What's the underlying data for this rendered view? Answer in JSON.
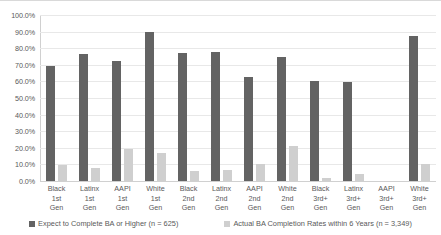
{
  "chart_data": {
    "type": "bar",
    "title": "",
    "xlabel": "",
    "ylabel": "",
    "ylim": [
      0,
      100
    ],
    "grid": true,
    "legend_position": "bottom",
    "categories": [
      "Black 1st Gen",
      "Latinx 1st Gen",
      "AAPI 1st Gen",
      "White 1st Gen",
      "Black 2nd Gen",
      "Latinx 2nd Gen",
      "AAPI 2nd Gen",
      "White 2nd Gen",
      "Black 3rd+ Gen",
      "Latinx 3rd+ Gen",
      "AAPI 3rd+ Gen",
      "White 3rd+ Gen"
    ],
    "category_lines": [
      [
        "Black",
        "1st",
        "Gen"
      ],
      [
        "Latinx",
        "1st",
        "Gen"
      ],
      [
        "AAPI",
        "1st",
        "Gen"
      ],
      [
        "White",
        "1st",
        "Gen"
      ],
      [
        "Black",
        "2nd",
        "Gen"
      ],
      [
        "Latinx",
        "2nd",
        "Gen"
      ],
      [
        "AAPI",
        "2nd",
        "Gen"
      ],
      [
        "White",
        "2nd",
        "Gen"
      ],
      [
        "Black",
        "3rd+",
        "Gen"
      ],
      [
        "Latinx",
        "3rd+",
        "Gen"
      ],
      [
        "AAPI",
        "3rd+",
        "Gen"
      ],
      [
        "White",
        "3rd+",
        "Gen"
      ]
    ],
    "series": [
      {
        "name": "Expect to Complete BA or Higher (n = 625)",
        "color": "#636363",
        "values": [
          69.5,
          76.5,
          72.0,
          90.0,
          77.0,
          78.0,
          62.5,
          75.0,
          60.5,
          59.5,
          null,
          87.5
        ]
      },
      {
        "name": "Actual BA Completion Rates within 6 Years (n = 3,349)",
        "color": "#cfcfcf",
        "values": [
          9.5,
          8.0,
          19.5,
          17.0,
          6.0,
          6.5,
          10.0,
          21.0,
          2.0,
          4.0,
          null,
          10.0
        ]
      }
    ],
    "ytick_labels": [
      "100.0%",
      "90.0%",
      "80.0%",
      "70.0%",
      "60.0%",
      "50.0%",
      "40.0%",
      "30.0%",
      "20.0%",
      "10.0%",
      "0.0%"
    ],
    "ytick_values": [
      100,
      90,
      80,
      70,
      60,
      50,
      40,
      30,
      20,
      10,
      0
    ]
  },
  "legend": [
    {
      "label": "Expect to Complete BA or Higher (n = 625)",
      "color": "#636363"
    },
    {
      "label": "Actual BA Completion Rates within 6 Years (n = 3,349)",
      "color": "#cfcfcf"
    }
  ]
}
